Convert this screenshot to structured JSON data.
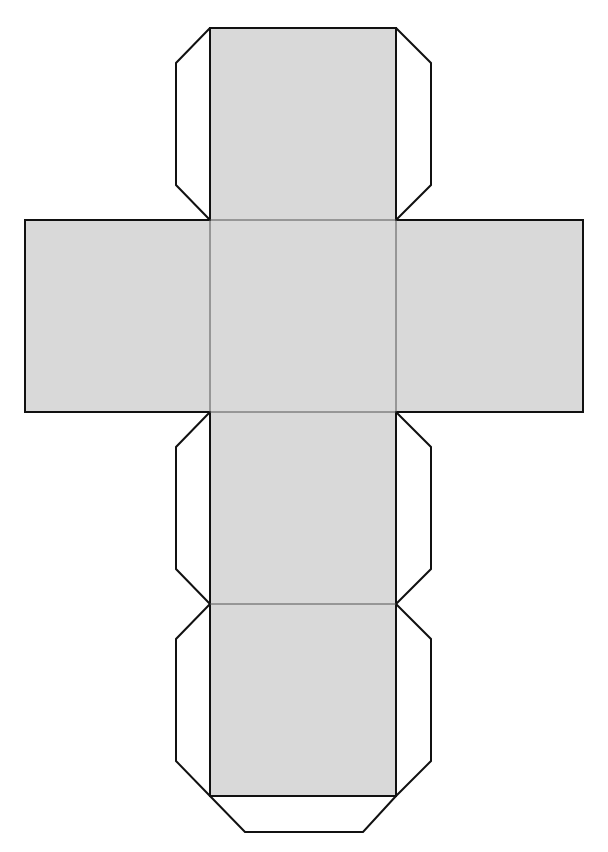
{
  "diagram": {
    "type": "cube-net",
    "colors": {
      "face_fill": "#d9d9d9",
      "tab_fill": "#ffffff",
      "outline": "#111111",
      "fold_line": "#555555"
    },
    "faces": [
      {
        "id": "top",
        "x": 210,
        "y": 28,
        "w": 186,
        "h": 192
      },
      {
        "id": "left",
        "x": 25,
        "y": 220,
        "w": 185,
        "h": 192
      },
      {
        "id": "center",
        "x": 210,
        "y": 220,
        "w": 186,
        "h": 192
      },
      {
        "id": "right",
        "x": 396,
        "y": 220,
        "w": 187,
        "h": 192
      },
      {
        "id": "lower",
        "x": 210,
        "y": 412,
        "w": 186,
        "h": 192
      },
      {
        "id": "bottom",
        "x": 210,
        "y": 604,
        "w": 186,
        "h": 192
      }
    ],
    "tabs": [
      {
        "id": "tab-top-left",
        "points": "210,28 176,63 176,185 210,220"
      },
      {
        "id": "tab-top-right",
        "points": "396,28 431,63 431,185 396,220"
      },
      {
        "id": "tab-lower-left",
        "points": "210,412 176,447 176,569 210,604"
      },
      {
        "id": "tab-lower-right",
        "points": "396,412 431,447 431,569 396,604"
      },
      {
        "id": "tab-bottom-left",
        "points": "210,604 176,639 176,761 210,796"
      },
      {
        "id": "tab-bottom-right",
        "points": "396,604 431,639 431,761 396,796"
      },
      {
        "id": "tab-bottom",
        "points": "210,796 245,832 363,832 396,796"
      }
    ]
  }
}
